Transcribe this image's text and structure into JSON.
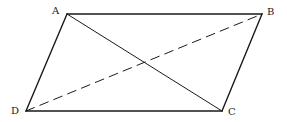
{
  "diagram": {
    "vertices": {
      "A": {
        "label": "A",
        "x": 67,
        "y": 14,
        "label_x": 52,
        "label_y": 14
      },
      "B": {
        "label": "B",
        "x": 262,
        "y": 14,
        "label_x": 267,
        "label_y": 15
      },
      "C": {
        "label": "C",
        "x": 222,
        "y": 111,
        "label_x": 228,
        "label_y": 115
      },
      "D": {
        "label": "D",
        "x": 26,
        "y": 111,
        "label_x": 11,
        "label_y": 114
      }
    },
    "edges": [
      {
        "from": "A",
        "to": "B",
        "style": "solid"
      },
      {
        "from": "B",
        "to": "C",
        "style": "solid"
      },
      {
        "from": "C",
        "to": "D",
        "style": "solid"
      },
      {
        "from": "D",
        "to": "A",
        "style": "solid"
      }
    ],
    "diagonals": [
      {
        "from": "A",
        "to": "C",
        "style": "solid"
      },
      {
        "from": "D",
        "to": "B",
        "style": "dashed"
      }
    ],
    "colors": {
      "stroke": "#1a1a1a",
      "background": "#ffffff"
    }
  }
}
